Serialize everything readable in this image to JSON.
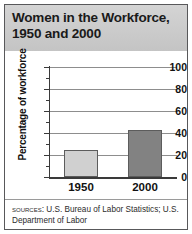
{
  "figure": {
    "title": "Women in the Workforce,\n1950 and 2000",
    "border_color": "#58585a",
    "header_background": "#c9c9c9"
  },
  "sources": {
    "label": "SOURCES:",
    "text": " U.S. Bureau of Labor Statistics; U.S. Department of Labor"
  },
  "chart_data": {
    "type": "bar",
    "title": "Women in the Workforce, 1950 and 2000",
    "xlabel": "",
    "ylabel": "Percentage of workforce",
    "categories": [
      "1950",
      "2000"
    ],
    "values": [
      24.5,
      43
    ],
    "ylim": [
      0,
      100
    ],
    "yticks": [
      0,
      20,
      40,
      60,
      80,
      100
    ],
    "ytick_labels": [
      "0",
      "20",
      "40",
      "60",
      "80",
      "100"
    ],
    "minor_tick_interval": 10,
    "grid": "horizontal",
    "legend": "none",
    "bar_colors": [
      "#d0d0d0",
      "#828282"
    ],
    "bar_edge_color": "#5c5c5c",
    "series": [
      {
        "name": "Percentage of workforce",
        "values": [
          24.5,
          43
        ]
      }
    ]
  }
}
